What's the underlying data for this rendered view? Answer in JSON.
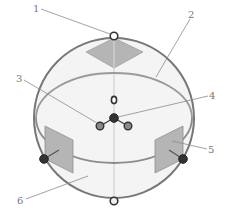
{
  "diagram": {
    "labels": [
      "1",
      "2",
      "3",
      "4",
      "5",
      "6"
    ],
    "colors": {
      "sphere_outline": "#777777",
      "sphere_fill": "#f4f4f4",
      "equator": "#8c8c8c",
      "panel_fill": "#b5b5b5",
      "panel_stroke": "#8f8f8f",
      "node_dark": "#333333",
      "node_mid": "#8a8a8a",
      "node_hollow": "#ffffff",
      "leader": "#8a8a8a"
    }
  }
}
